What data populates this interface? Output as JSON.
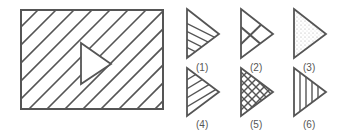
{
  "figure": {
    "main": {
      "description": "rectangle with diagonal hatching and a white triangle cutout pointing right"
    },
    "options": [
      {
        "label": "(1)",
        "pattern": "diagonal-lines-one-direction"
      },
      {
        "label": "(2)",
        "pattern": "two-crossing-lines"
      },
      {
        "label": "(3)",
        "pattern": "dotted"
      },
      {
        "label": "(4)",
        "pattern": "diagonal-lines-other-direction"
      },
      {
        "label": "(5)",
        "pattern": "crosshatch-grid"
      },
      {
        "label": "(6)",
        "pattern": "vertical-lines"
      }
    ],
    "colors": {
      "stroke": "#555555",
      "background": "#ffffff"
    }
  }
}
